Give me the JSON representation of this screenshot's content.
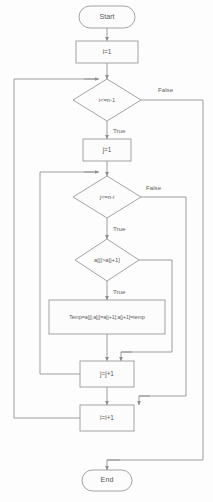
{
  "diagram": {
    "type": "flowchart",
    "colors": {
      "background": "#fdfdfd",
      "shape_fill": "#fcfcfc",
      "shape_stroke": "#9a9a9a",
      "connector": "#8d8d8d",
      "text": "#5a5a5a"
    }
  },
  "nodes": {
    "start": {
      "label": "Start",
      "shape": "terminal"
    },
    "init_i": {
      "label": "i=1",
      "shape": "process"
    },
    "cond_outer": {
      "label": "i<=n-1",
      "shape": "decision"
    },
    "init_j": {
      "label": "j=1",
      "shape": "process"
    },
    "cond_inner": {
      "label": "j<=n-i",
      "shape": "decision"
    },
    "cond_compare": {
      "label": "a[j]>a[j+1]",
      "shape": "decision"
    },
    "swap": {
      "label": "Temp=a[j];a[j]=a[j+1];a[j+1]=temp",
      "shape": "process"
    },
    "inc_j": {
      "label": "j=j+1",
      "shape": "process"
    },
    "inc_i": {
      "label": "i=i+1",
      "shape": "process"
    },
    "end": {
      "label": "End",
      "shape": "terminal"
    }
  },
  "edge_labels": {
    "outer_false": "False",
    "outer_true": "True",
    "inner_false": "False",
    "inner_true": "True",
    "compare_false": "False",
    "compare_true": "True"
  },
  "caption": {
    "text": ""
  }
}
